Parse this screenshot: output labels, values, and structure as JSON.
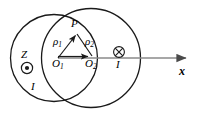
{
  "figure": {
    "background_color": "#ffffff",
    "stroke_color": "#1a1a1a",
    "axis_color": "#808080",
    "width": 205,
    "height": 115
  },
  "labels": {
    "point_p": "P",
    "rho1": "ρ1",
    "rho1_base": "ρ",
    "rho1_sub": "1",
    "rho2_base": "ρ",
    "rho2_sub": "2",
    "origin1_base": "O",
    "origin1_sub": "1",
    "origin2_base": "O",
    "origin2_sub": "2",
    "z_axis": "Z",
    "current_left": "I",
    "current_right": "I",
    "x_axis": "x"
  },
  "symbols": {
    "current_out_of_page": "dot-in-circle-icon",
    "current_into_page": "cross-in-circle-icon",
    "vector_rho1": "arrow-from-O1-to-P",
    "vector_rho2": "arrow-from-P-to-O2",
    "vector_d": "arrow-from-O1-to-O2",
    "axis_arrow": "arrow-right-x-axis"
  },
  "geometry": {
    "circle_left": {
      "cx": 54,
      "cy": 58,
      "r": 50
    },
    "circle_right": {
      "cx": 91,
      "cy": 58,
      "r": 50
    },
    "point_p": {
      "x": 76,
      "y": 33
    },
    "origin1": {
      "x": 58,
      "y": 58
    },
    "origin2": {
      "x": 92,
      "y": 58
    },
    "axis_y": 58,
    "axis_end_x": 192,
    "out_of_page_symbol": {
      "cx": 27,
      "cy": 68,
      "r": 6
    },
    "into_page_symbol": {
      "cx": 119,
      "cy": 52,
      "r": 5.5
    }
  }
}
